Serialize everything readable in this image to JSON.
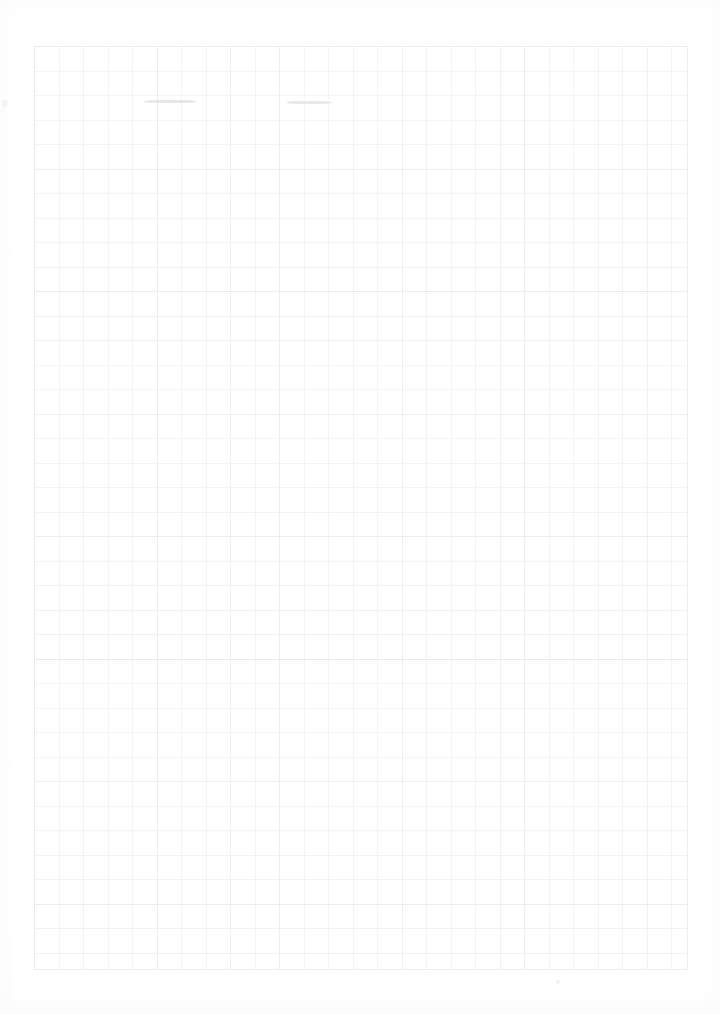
{
  "document": {
    "kind": "scanned-grid-paper",
    "title": "Blank Graph Paper Sheet",
    "caption": "",
    "page_width": 720,
    "page_height": 1014,
    "background_color": "#ffffff",
    "paper_tint": "#fdfdfe"
  },
  "grid": {
    "label": "square-grid",
    "origin_x": 34,
    "origin_y": 46,
    "width": 654,
    "height": 924,
    "cell_size": 24.5,
    "columns": 27,
    "rows": 38,
    "line_color": "#eeeef1",
    "line_color_strong": "#e6e6ea",
    "line_width": 1,
    "border_color": "#ebebef"
  },
  "marks": [
    {
      "name": "pencil-smudge-left",
      "x": 144,
      "y": 100,
      "width": 52,
      "height": 3,
      "color": "#e2e2e6",
      "opacity": 0.85
    },
    {
      "name": "pencil-smudge-right",
      "x": 286,
      "y": 101,
      "width": 46,
      "height": 3,
      "color": "#e4e4e8",
      "opacity": 0.8
    },
    {
      "name": "scan-speck-edge",
      "x": 2,
      "y": 100,
      "width": 5,
      "height": 7,
      "color": "#ededf0",
      "opacity": 0.9
    },
    {
      "name": "scan-speck-bottom",
      "x": 556,
      "y": 980,
      "width": 4,
      "height": 4,
      "color": "#f2f2f5",
      "opacity": 0.9
    }
  ],
  "chart_data": {
    "type": "table",
    "xlabel": "",
    "ylabel": "",
    "columns": [],
    "rows": []
  }
}
